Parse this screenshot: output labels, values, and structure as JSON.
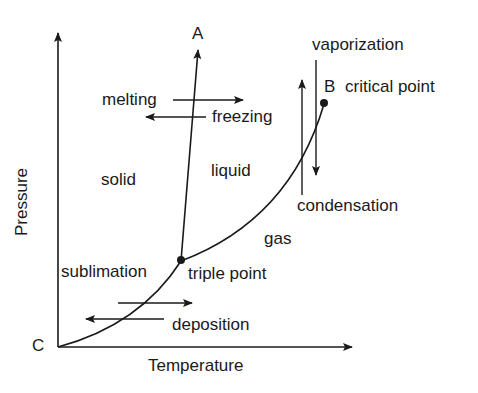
{
  "diagram": {
    "axes": {
      "x_label": "Temperature",
      "y_label": "Pressure"
    },
    "points": {
      "A": "A",
      "B": "B",
      "C": "C",
      "critical_point": "critical point",
      "triple_point": "triple point"
    },
    "regions": {
      "solid": "solid",
      "liquid": "liquid",
      "gas": "gas"
    },
    "transitions": {
      "melting": "melting",
      "freezing": "freezing",
      "vaporization": "vaporization",
      "condensation": "condensation",
      "sublimation": "sublimation",
      "deposition": "deposition"
    },
    "colors": {
      "ink": "#1a1a1a",
      "background": "#ffffff"
    }
  }
}
